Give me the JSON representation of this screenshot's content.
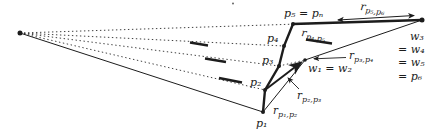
{
  "figure": {
    "colors": {
      "ink": "#1c1c1c",
      "background": "#ffffff"
    },
    "labels": {
      "p5_pn": "p₅ = pₙ",
      "p4": "p₄",
      "p3": "p₃",
      "p2": "p₂",
      "p1": "p₁",
      "w12": "w₁ = w₂",
      "w3": "w₃",
      "w4": "= w₄",
      "w5": "= w₅",
      "p6": "= p₆",
      "r56": {
        "base": "r",
        "sub": "p₅,p₆"
      },
      "r45": {
        "base": "r",
        "sub": "p₄,p₅"
      },
      "r34": {
        "base": "r",
        "sub": "p₃,p₄"
      },
      "r23": {
        "base": "r",
        "sub": "p₂,p₃"
      },
      "r12": {
        "base": "r",
        "sub": "p₁,p₂"
      }
    }
  }
}
